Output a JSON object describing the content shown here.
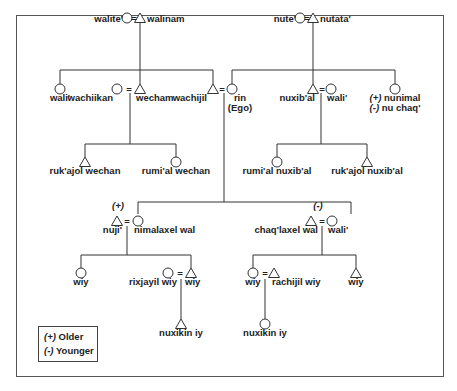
{
  "diagram": {
    "type": "kinship-chart",
    "legend": {
      "items": [
        {
          "sign": "(+)",
          "label": "Older"
        },
        {
          "sign": "(-)",
          "label": "Younger"
        }
      ]
    },
    "marriage_symbol": "=",
    "people": {
      "walite": {
        "term": "walite'",
        "sex": "female"
      },
      "walinam": {
        "term": "walinam",
        "sex": "male"
      },
      "nute": {
        "term": "nute'",
        "sex": "female"
      },
      "nutata": {
        "term": "nutata'",
        "sex": "male"
      },
      "wali_1": {
        "term": "wali'",
        "sex": "female"
      },
      "wachiikan": {
        "term": "wachiikan",
        "sex": "female"
      },
      "wecham": {
        "term": "wecham",
        "sex": "male"
      },
      "wachijil": {
        "term": "wachijil",
        "sex": "male"
      },
      "rin": {
        "term": "rin",
        "note": "(Ego)",
        "sex": "female"
      },
      "nuxibal": {
        "term": "nuxib'al",
        "sex": "male"
      },
      "wali_2": {
        "term": "wali'",
        "sex": "female"
      },
      "nunimal": {
        "term": "nunimal",
        "term_prefix": "(+)",
        "alt_term": "nu chaq'",
        "alt_prefix": "(-)",
        "sex": "female"
      },
      "rukajol_wechan": {
        "term": "ruk'ajol wechan",
        "sex": "male"
      },
      "rumial_wechan": {
        "term": "rumi'al wechan",
        "sex": "female"
      },
      "rumial_nuxibal": {
        "term": "rumi'al nuxib'al",
        "sex": "female"
      },
      "rukajol_nuxibal": {
        "term": "ruk'ajol nuxib'al",
        "sex": "male"
      },
      "nuji": {
        "term": "nuji'",
        "sex": "male",
        "age_marker": "(+)"
      },
      "nimalaxel_wal": {
        "term": "nimalaxel wal",
        "sex": "female"
      },
      "chaqlaxel_wal": {
        "term": "chaq'laxel wal",
        "sex": "male",
        "age_marker": "(-)"
      },
      "wali_3": {
        "term": "wali'",
        "sex": "female"
      },
      "wiy_1": {
        "term": "wiy",
        "sex": "female"
      },
      "rixjayil_wiy": {
        "term": "rixjayil wiy",
        "sex": "female"
      },
      "wiy_2": {
        "term": "wiy",
        "sex": "male"
      },
      "nuxikin_iy_1": {
        "term": "nuxikin iy",
        "sex": "male"
      },
      "wiy_3": {
        "term": "wiy",
        "sex": "female"
      },
      "rachijil_wiy": {
        "term": "rachijil wiy",
        "sex": "male"
      },
      "wiy_4": {
        "term": "wiy",
        "sex": "male"
      },
      "nuxikin_iy_2": {
        "term": "nuxikin iy",
        "sex": "female"
      }
    }
  }
}
